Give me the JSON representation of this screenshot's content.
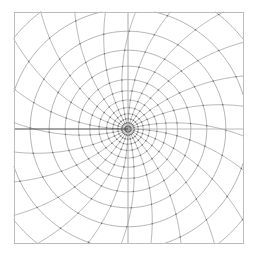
{
  "figure": {
    "title": "",
    "kind": "conformal-mesh-plot",
    "canvas": {
      "width": 256,
      "height": 258
    },
    "background_color": "#ffffff"
  },
  "frame": {
    "x": 14,
    "y": 12,
    "width": 229,
    "height": 231,
    "stroke_color": "#b9b9b9",
    "stroke_width": 1
  },
  "chart_data": {
    "type": "line",
    "xlabel": "",
    "ylabel": "",
    "grid": true,
    "legend_position": "none",
    "center": {
      "x": 128,
      "y": 129
    },
    "radial_spokes": 24,
    "ring_count": 13,
    "ring_radii": [
      3.0,
      6.2,
      10.2,
      15.2,
      21.4,
      29.0,
      38.2,
      49.4,
      62.8,
      78.8,
      97.8,
      120.0,
      146.0
    ],
    "spoke_angles_deg": [
      0,
      15,
      30,
      45,
      60,
      75,
      90,
      105,
      120,
      135,
      150,
      165,
      180,
      195,
      210,
      225,
      240,
      255,
      270,
      285,
      300,
      315,
      330,
      345
    ],
    "warp": {
      "description": "radial lines bend counter-clockwise with radius; rings are deformed circles clipped to the square frame",
      "twist_per_unit_radius_deg": 0.16,
      "squash_x": 1.0,
      "squash_y": 1.0
    },
    "series": [
      {
        "name": "radial-spokes",
        "color": "#9a9a9a",
        "width": 0.7
      },
      {
        "name": "rings",
        "color": "#8f8f8f",
        "width": 0.7
      },
      {
        "name": "branch-cut",
        "color": "#4a4a4a",
        "width": 1.1
      },
      {
        "name": "axis-vertical",
        "color": "#a0a0a0",
        "width": 0.9
      },
      {
        "name": "axis-horizontal-right",
        "color": "#a8a8a8",
        "width": 0.8
      }
    ]
  },
  "colors": {
    "mesh": "#949494",
    "mesh_dark": "#6f6f6f",
    "branch_cut": "#4a4a4a",
    "frame": "#bcbcbc",
    "node": "#6a6a6a",
    "background": "#ffffff"
  },
  "axes": {
    "branch_cut": {
      "from_x": 14,
      "to_x": 128,
      "y": 129
    },
    "right_axis": {
      "from_x": 128,
      "to_x": 243,
      "y": 129
    },
    "vertical_axis": {
      "x": 128,
      "from_y": 12,
      "to_y": 243
    }
  },
  "labels": {
    "tick_labels_x": [],
    "tick_labels_y": [],
    "annotations": []
  }
}
